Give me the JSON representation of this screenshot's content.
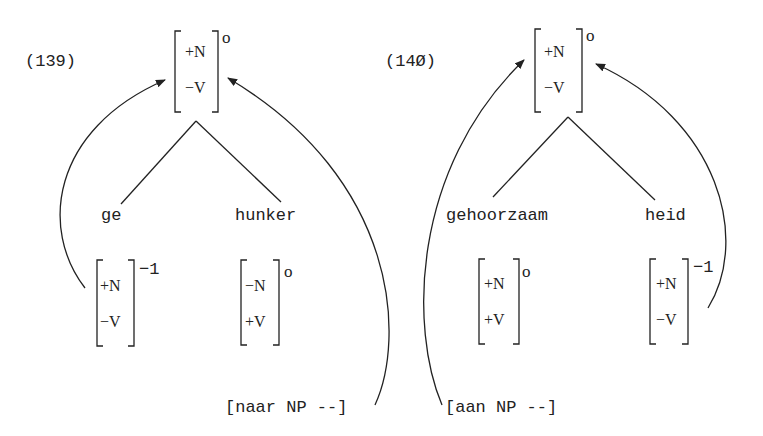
{
  "examples": [
    {
      "number": "(139)",
      "root": {
        "features": [
          "+N",
          "−V"
        ],
        "level": "o"
      },
      "left": {
        "word": "ge",
        "features": [
          "+N",
          "−V"
        ],
        "level": "−1"
      },
      "right": {
        "word": "hunker",
        "features": [
          "−N",
          "+V"
        ],
        "level": "o"
      },
      "subcat_frame": "[naar NP --]"
    },
    {
      "number": "(14Ø)",
      "root": {
        "features": [
          "+N",
          "−V"
        ],
        "level": "o"
      },
      "left": {
        "word": "gehoorzaam",
        "features": [
          "+N",
          "+V"
        ],
        "level": "o"
      },
      "right": {
        "word": "heid",
        "features": [
          "+N",
          "−V"
        ],
        "level": "−1"
      },
      "subcat_frame": "[aan NP --]"
    }
  ],
  "colors": {
    "ink": "#222222",
    "background": "#ffffff"
  }
}
